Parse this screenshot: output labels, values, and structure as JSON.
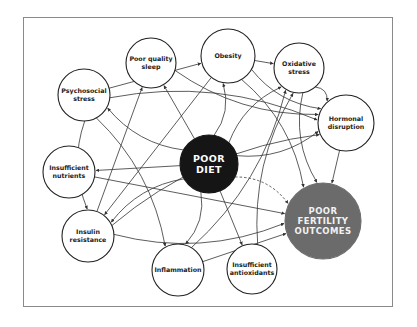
{
  "diagram": {
    "colors": {
      "frame": "#8a8a8a",
      "node_stroke": "#222222",
      "node_fill": "#ffffff",
      "diet_fill": "#151515",
      "outcome_fill": "#6b6b6b",
      "edge": "#333333"
    },
    "nodes": {
      "poor_diet": {
        "label": "POOR\nDIET",
        "cx": 209,
        "cy": 164,
        "r": 29,
        "style": "dark"
      },
      "poor_fertility": {
        "label": "POOR\nFERTILITY\nOUTCOMES",
        "cx": 323,
        "cy": 221,
        "r": 38,
        "style": "gray"
      },
      "poor_sleep": {
        "label": "Poor quality\nsleep",
        "cx": 151,
        "cy": 63,
        "r": 25,
        "style": "light"
      },
      "obesity": {
        "label": "Obesity",
        "cx": 228,
        "cy": 56,
        "r": 27,
        "style": "light"
      },
      "oxidative_stress": {
        "label": "Oxidative\nstress",
        "cx": 299,
        "cy": 68,
        "r": 25,
        "style": "light"
      },
      "psychosocial_stress": {
        "label": "Psychosocial\nstress",
        "cx": 84,
        "cy": 95,
        "r": 26,
        "style": "light"
      },
      "hormonal_disruption": {
        "label": "Hormonal\ndisruption",
        "cx": 346,
        "cy": 123,
        "r": 28,
        "style": "light"
      },
      "insufficient_nutrients": {
        "label": "Insufficient\nnutrients",
        "cx": 69,
        "cy": 172,
        "r": 26,
        "style": "light"
      },
      "insulin_resistance": {
        "label": "Insulin\nresistance",
        "cx": 88,
        "cy": 236,
        "r": 26,
        "style": "light"
      },
      "inflammation": {
        "label": "Inflammation",
        "cx": 178,
        "cy": 270,
        "r": 26,
        "style": "light"
      },
      "insufficient_antioxidants": {
        "label": "Insufficient\nantioxidants",
        "cx": 252,
        "cy": 269,
        "r": 25,
        "style": "light"
      }
    },
    "edges": [
      {
        "from": "poor_diet",
        "to": "poor_fertility",
        "dashed": true
      },
      {
        "from": "poor_diet",
        "to": "poor_sleep"
      },
      {
        "from": "poor_diet",
        "to": "obesity"
      },
      {
        "from": "poor_diet",
        "to": "psychosocial_stress"
      },
      {
        "from": "poor_diet",
        "to": "insufficient_nutrients"
      },
      {
        "from": "poor_diet",
        "to": "insulin_resistance"
      },
      {
        "from": "poor_diet",
        "to": "inflammation"
      },
      {
        "from": "poor_diet",
        "to": "insufficient_antioxidants"
      },
      {
        "from": "poor_diet",
        "to": "hormonal_disruption"
      },
      {
        "from": "poor_diet",
        "to": "oxidative_stress"
      },
      {
        "from": "obesity",
        "to": "oxidative_stress"
      },
      {
        "from": "obesity",
        "to": "hormonal_disruption"
      },
      {
        "from": "obesity",
        "to": "poor_fertility"
      },
      {
        "from": "obesity",
        "to": "insulin_resistance"
      },
      {
        "from": "oxidative_stress",
        "to": "poor_fertility"
      },
      {
        "from": "oxidative_stress",
        "to": "hormonal_disruption"
      },
      {
        "from": "hormonal_disruption",
        "to": "poor_fertility"
      },
      {
        "from": "poor_sleep",
        "to": "hormonal_disruption"
      },
      {
        "from": "psychosocial_stress",
        "to": "hormonal_disruption"
      },
      {
        "from": "psychosocial_stress",
        "to": "obesity"
      },
      {
        "from": "psychosocial_stress",
        "to": "insulin_resistance"
      },
      {
        "from": "psychosocial_stress",
        "to": "inflammation"
      },
      {
        "from": "insufficient_nutrients",
        "to": "poor_fertility"
      },
      {
        "from": "insulin_resistance",
        "to": "poor_fertility"
      },
      {
        "from": "insulin_resistance",
        "to": "hormonal_disruption"
      },
      {
        "from": "inflammation",
        "to": "poor_fertility"
      },
      {
        "from": "inflammation",
        "to": "oxidative_stress"
      },
      {
        "from": "insufficient_antioxidants",
        "to": "oxidative_stress"
      },
      {
        "from": "insulin_resistance",
        "to": "poor_sleep"
      }
    ]
  }
}
